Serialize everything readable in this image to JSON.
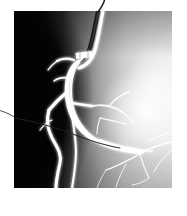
{
  "figure": {
    "kind": "medical-x-ray-angiogram",
    "modality_label": "coronary angiogram",
    "alt_text": "Black and white coronary angiogram showing contrast-filled artery with side branches, catheter entering from top and a guidewire crossing from the left",
    "plate": {
      "left": 14,
      "top": 11,
      "width": 158,
      "height": 177,
      "background_color": "#ffffff"
    },
    "tones": {
      "page_background": "#ffffff",
      "deep_shadow": "#050505",
      "dark_field": "#111111",
      "mid_gray": "#9a9a9a",
      "light_gray": "#d2d2d2",
      "bright_field": "#f2f2f2",
      "hotspot": "#fdfdfd",
      "vessel_contrast": "#ffffff",
      "catheter_dark": "#1a1a1a",
      "guidewire": "#2a2a2a"
    },
    "regions": [
      {
        "name": "dark-left-field",
        "description": "dense black region occupying the left third of the plate"
      },
      {
        "name": "bright-right-field",
        "description": "bright overexposed lung field on the right with a hotspot"
      },
      {
        "name": "soft-tissue-edge",
        "description": "curved luminance boundary sweeping from top-left down to bottom-center"
      }
    ],
    "structures": [
      {
        "name": "main-artery",
        "description": "large white contrast-filled vessel running vertically through the centre"
      },
      {
        "name": "stent-marker",
        "description": "short rectangular brighter segment near the upper vessel bend"
      },
      {
        "name": "upper-side-branch",
        "description": "branch leaving the main vessel toward the upper left"
      },
      {
        "name": "mid-bifurcation",
        "description": "bifurcation at mid-height splitting left and right"
      },
      {
        "name": "lower-left-branch",
        "description": "serpentine branch descending to the lower left"
      },
      {
        "name": "distal-branches",
        "description": "faint thin branches fanning across the bright lower right"
      },
      {
        "name": "catheter",
        "description": "dark catheter entering the frame from the top and curving down into the vessel"
      },
      {
        "name": "guidewire",
        "description": "thin dark wire crossing in from the left edge toward the vessel"
      }
    ]
  }
}
